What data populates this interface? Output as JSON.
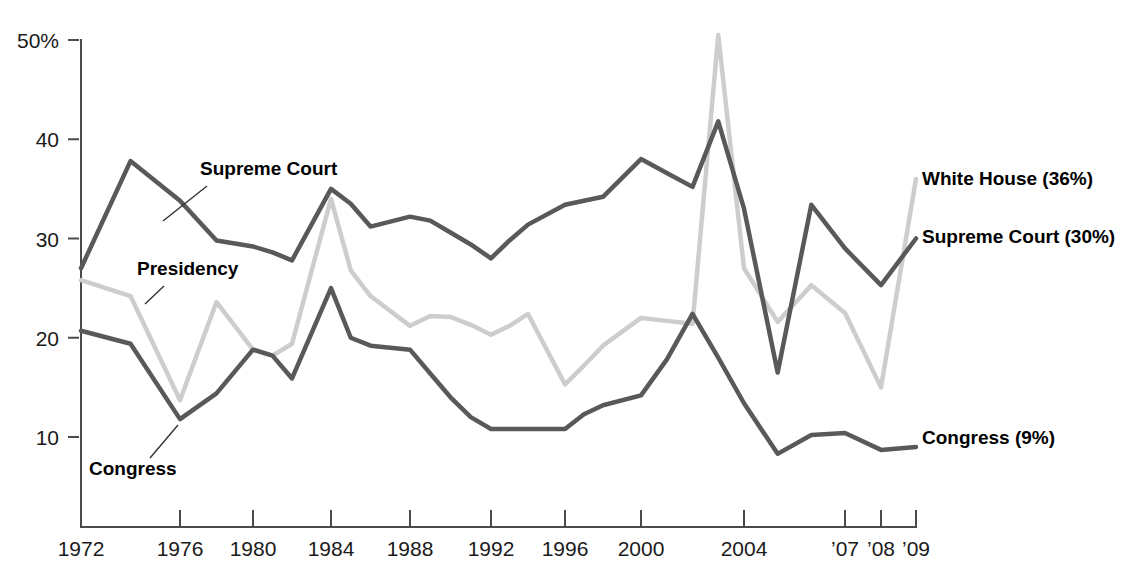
{
  "chart_data": {
    "type": "line",
    "title": "",
    "subtitle": "",
    "xlabel": "",
    "ylabel": "",
    "xlim": [
      1972,
      2009
    ],
    "ylim": [
      0,
      50
    ],
    "grid": false,
    "legend_position": "inline-annotations",
    "y_ticks": [
      {
        "value": 50,
        "label": "50%"
      },
      {
        "value": 40,
        "label": "40"
      },
      {
        "value": 30,
        "label": "30"
      },
      {
        "value": 20,
        "label": "20"
      },
      {
        "value": 10,
        "label": "10"
      }
    ],
    "x_ticks": [
      {
        "value": 1972,
        "label": "1972"
      },
      {
        "value": 1976,
        "label": "1976"
      },
      {
        "value": 1980,
        "label": "1980"
      },
      {
        "value": 1984,
        "label": "1984"
      },
      {
        "value": 1988,
        "label": "1988"
      },
      {
        "value": 1992,
        "label": "1992"
      },
      {
        "value": 1996,
        "label": "1996"
      },
      {
        "value": 2000,
        "label": "2000"
      },
      {
        "value": 2004,
        "label": "2004"
      },
      {
        "value": 2007,
        "label": "’07"
      },
      {
        "value": 2008,
        "label": "’08"
      },
      {
        "value": 2009,
        "label": "’09"
      }
    ],
    "series": [
      {
        "name": "Supreme Court",
        "color": "#595959",
        "end_label": "Supreme Court (30%)",
        "end_value": 30,
        "x": [
          1972,
          1974,
          1976,
          1978,
          1980,
          1981,
          1982,
          1984,
          1985,
          1986,
          1988,
          1989,
          1990,
          1991,
          1992,
          1993,
          1994,
          1996,
          1997,
          1998,
          2000,
          2001,
          2002,
          2003,
          2004,
          2005,
          2006,
          2007,
          2008,
          2009
        ],
        "y": [
          27,
          37.8,
          33.8,
          29.8,
          29.2,
          28.6,
          27.8,
          35,
          33.5,
          31.2,
          32.2,
          31.8,
          30.6,
          29.4,
          28,
          29.8,
          31.4,
          33.4,
          33.8,
          34.2,
          38,
          36.6,
          35.2,
          41.8,
          33,
          16.5,
          33.4,
          29,
          25.3,
          30
        ]
      },
      {
        "name": "Presidency",
        "color": "#cdcdcd",
        "end_label": "White House (36%)",
        "end_value": 36,
        "x": [
          1972,
          1974,
          1976,
          1978,
          1980,
          1981,
          1982,
          1984,
          1985,
          1986,
          1988,
          1989,
          1990,
          1991,
          1992,
          1993,
          1994,
          1996,
          1997,
          1998,
          2000,
          2001,
          2002,
          2003,
          2004,
          2005,
          2006,
          2007,
          2008,
          2009
        ],
        "y": [
          25.8,
          24.2,
          13.7,
          23.6,
          18.8,
          18.2,
          19.4,
          34,
          26.8,
          24.2,
          21.2,
          22.2,
          22.1,
          21.3,
          20.3,
          21.2,
          22.4,
          15.3,
          17.2,
          19.2,
          22,
          21.7,
          21.4,
          50.5,
          27,
          21.6,
          25.3,
          22.5,
          15,
          36
        ]
      },
      {
        "name": "Congress",
        "color": "#595959",
        "end_label": "Congress (9%)",
        "end_value": 9,
        "x": [
          1972,
          1974,
          1976,
          1978,
          1980,
          1981,
          1982,
          1984,
          1985,
          1986,
          1988,
          1989,
          1990,
          1991,
          1992,
          1993,
          1994,
          1996,
          1997,
          1998,
          2000,
          2001,
          2002,
          2003,
          2004,
          2005,
          2006,
          2007,
          2008,
          2009
        ],
        "y": [
          20.7,
          19.4,
          11.8,
          14.4,
          18.8,
          18.2,
          15.9,
          25,
          20,
          19.2,
          18.8,
          16.4,
          14,
          12,
          10.8,
          10.8,
          10.8,
          10.8,
          12.3,
          13.2,
          14.2,
          17.8,
          22.4,
          18,
          13.4,
          8.3,
          10.2,
          10.4,
          8.7,
          9
        ]
      }
    ],
    "annotations": [
      {
        "text": "Supreme Court",
        "target_series": "Supreme Court",
        "label_x": 200,
        "label_y": 175,
        "leader_from_x": 207,
        "leader_from_y": 186,
        "leader_to_x": 163,
        "leader_to_y": 221
      },
      {
        "text": "Presidency",
        "target_series": "Presidency",
        "label_x": 137,
        "label_y": 275,
        "leader_from_x": 164,
        "leader_from_y": 286,
        "leader_to_x": 145,
        "leader_to_y": 304
      },
      {
        "text": "Congress",
        "target_series": "Congress",
        "label_x": 89,
        "label_y": 475,
        "leader_from_x": 150,
        "leader_from_y": 458,
        "leader_to_x": 178,
        "leader_to_y": 425
      }
    ],
    "end_labels": [
      {
        "text": "White House (36%)",
        "x": 922,
        "y": 185,
        "series": "Presidency"
      },
      {
        "text": "Supreme Court (30%)",
        "x": 922,
        "y": 243,
        "series": "Supreme Court"
      },
      {
        "text": "Congress (9%)",
        "x": 922,
        "y": 444,
        "series": "Congress"
      }
    ]
  },
  "colors": {
    "axis": "#4a4a4a",
    "text": "#1a1a1a",
    "supreme_court": "#595959",
    "presidency": "#cdcdcd",
    "congress": "#595959",
    "background": "#ffffff"
  }
}
